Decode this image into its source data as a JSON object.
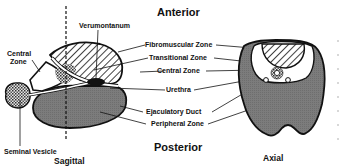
{
  "diagram": {
    "orientation": {
      "top": "Anterior",
      "bottom": "Posterior"
    },
    "views": [
      {
        "id": "sagittal",
        "caption": "Sagittal"
      },
      {
        "id": "axial",
        "caption": "Axial"
      }
    ],
    "labels": {
      "verumontanum": "Verumontanum",
      "central_zone_left_line1": "Central",
      "central_zone_left_line2": "Zone",
      "seminal_vesicle": "Seminal Vesicle",
      "fibromuscular_zone": "Fibromuscular Zone",
      "transitional_zone": "Transitional Zone",
      "central_zone": "Central Zone",
      "urethra": "Urethra",
      "ejaculatory_duct": "Ejaculatory Duct",
      "peripheral_zone": "Peripheral Zone"
    },
    "colors": {
      "background": "#ffffff",
      "outline": "#111111",
      "peripheral_fill": "#7a7a7a",
      "hatch": "#111111",
      "stipple_light": "#e8e8e8",
      "stipple_dark": "#333333",
      "label_text": "#111111"
    }
  }
}
